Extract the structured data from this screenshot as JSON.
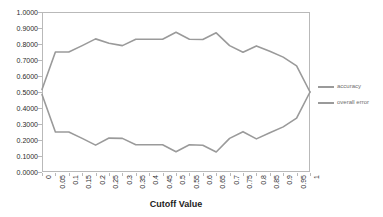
{
  "chart_data": {
    "type": "line",
    "title": "",
    "xlabel": "Cutoff Value",
    "ylabel": "",
    "xlim": [
      0,
      1
    ],
    "ylim": [
      0.0,
      1.0
    ],
    "grid": false,
    "legend_position": "right",
    "x": [
      0,
      0.05,
      0.1,
      0.15,
      0.2,
      0.25,
      0.3,
      0.35,
      0.4,
      0.45,
      0.5,
      0.55,
      0.6,
      0.65,
      0.7,
      0.75,
      0.8,
      0.85,
      0.9,
      0.95,
      1
    ],
    "x_tick_labels": [
      "0",
      "0.05",
      "0.1",
      "0.15",
      "0.2",
      "0.25",
      "0.3",
      "0.35",
      "0.4",
      "0.45",
      "0.5",
      "0.55",
      "0.6",
      "0.65",
      "0.7",
      "0.75",
      "0.8",
      "0.85",
      "0.9",
      "0.95",
      "1"
    ],
    "y_tick_labels": [
      "0.0000",
      "0.1000",
      "0.2000",
      "0.3000",
      "0.4000",
      "0.5000",
      "0.6000",
      "0.7000",
      "0.8000",
      "0.9000",
      "1.0000"
    ],
    "y_tick_values": [
      0.0,
      0.1,
      0.2,
      0.3,
      0.4,
      0.5,
      0.6,
      0.7,
      0.8,
      0.9,
      1.0
    ],
    "series": [
      {
        "name": "accuracy",
        "color": "#9a9a9a",
        "values": [
          0.515,
          0.75,
          0.75,
          0.79,
          0.832,
          0.805,
          0.79,
          0.83,
          0.83,
          0.83,
          0.873,
          0.83,
          0.828,
          0.87,
          0.79,
          0.748,
          0.788,
          0.755,
          0.718,
          0.663,
          0.5
        ]
      },
      {
        "name": "overall error",
        "color": "#9a9a9a",
        "values": [
          0.485,
          0.25,
          0.25,
          0.21,
          0.168,
          0.212,
          0.21,
          0.17,
          0.17,
          0.17,
          0.127,
          0.17,
          0.167,
          0.125,
          0.21,
          0.252,
          0.207,
          0.245,
          0.282,
          0.337,
          0.5
        ]
      }
    ]
  },
  "legend": {
    "items": [
      {
        "label": "accuracy",
        "color": "#9a9a9a"
      },
      {
        "label": "overall error",
        "color": "#9a9a9a"
      }
    ]
  },
  "axis": {
    "x_title": "Cutoff Value"
  },
  "colors": {
    "line": "#9a9a9a",
    "frame": "#b9b9b9",
    "text": "#2b2b2b",
    "legend_text": "#6f6f6f"
  }
}
